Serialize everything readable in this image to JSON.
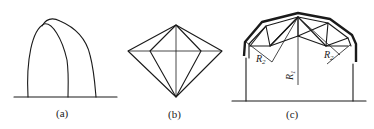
{
  "figure": {
    "panels": [
      {
        "id": "a",
        "caption": "(a)",
        "description": "two overlapping arches on a ground line"
      },
      {
        "id": "b",
        "caption": "(b)",
        "description": "diamond / pyramid wireframe viewed from above"
      },
      {
        "id": "c",
        "caption": "(c)",
        "description": "trussed arched roof on two columns with radius annotations"
      }
    ],
    "annotations": {
      "r1": "R",
      "r1_sub": "1",
      "r2_left": "R",
      "r2_left_sub": "2",
      "r2_right": "R",
      "r2_right_sub": "2"
    },
    "colors": {
      "line": "#1a1a1a",
      "background": "#ffffff"
    }
  }
}
